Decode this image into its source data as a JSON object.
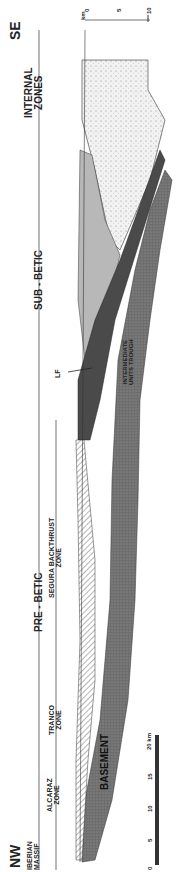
{
  "diagram": {
    "title_orientation": {
      "left": "NW",
      "right": "SE"
    },
    "zones": [
      {
        "id": "iberian",
        "label_line1": "IBERIAN",
        "label_line2": "MASSIF"
      },
      {
        "id": "alcaraz",
        "label_line1": "ALCARAZ",
        "label_line2": "ZONE"
      },
      {
        "id": "tranco",
        "label_line1": "TRANCO",
        "label_line2": "ZONE"
      },
      {
        "id": "segura",
        "label_line1": "SEGURA BACKTHRUST",
        "label_line2": "ZONE"
      },
      {
        "id": "prebetic",
        "label": "PRE - BETIC"
      },
      {
        "id": "subbetic",
        "label": "SUB - BETIC"
      },
      {
        "id": "internal",
        "label_line1": "INTERNAL",
        "label_line2": "ZONES"
      }
    ],
    "units": {
      "basement": "BASEMENT",
      "trough_line1": "INTERMEDIATE",
      "trough_line2": "UNITS TROUGH",
      "fault": "LF"
    },
    "depth_scale": {
      "unit": "km",
      "ticks": [
        "0",
        "5",
        "10"
      ]
    },
    "horizontal_scale": {
      "unit": "20 km",
      "ticks": [
        "0",
        "5",
        "10",
        "15",
        "20"
      ]
    },
    "colors": {
      "basement": "#6b6b6b",
      "subbetic_dark": "#4a4a4a",
      "subbetic_light": "#b5b5b5",
      "internal": "#efefef",
      "line": "#222222"
    }
  }
}
